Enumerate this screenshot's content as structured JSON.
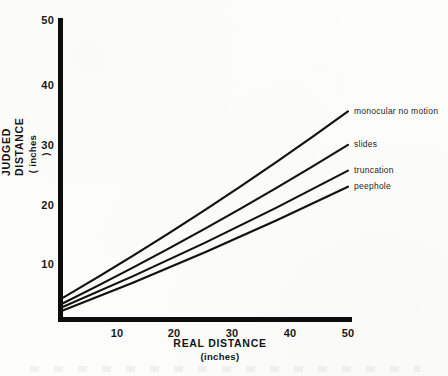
{
  "chart_data": {
    "type": "line",
    "title": "",
    "xlabel": "REAL DISTANCE",
    "xlabel_units": "(inches)",
    "ylabel": "JUDGED DISTANCE",
    "ylabel_units": "( inches )",
    "xlim": [
      0,
      50
    ],
    "ylim": [
      0,
      50
    ],
    "xticks": [
      10,
      20,
      30,
      40,
      50
    ],
    "yticks": [
      10,
      20,
      30,
      40,
      50
    ],
    "xtick_labels": [
      "10",
      "20",
      "30",
      "40",
      "50"
    ],
    "ytick_labels": [
      "10",
      "20",
      "30",
      "40",
      "50"
    ],
    "grid": false,
    "legend_position": "right-inline-at-line-ends",
    "x": [
      0,
      50
    ],
    "series": [
      {
        "name": "monocular no motion",
        "label": "monocular no motion",
        "values": [
          3.5,
          34.8
        ],
        "intercept": 3.5,
        "slope": 0.626,
        "color": "#111111",
        "label_y_px": 111
      },
      {
        "name": "slides",
        "label": "slides",
        "values": [
          2.6,
          29.2
        ],
        "intercept": 2.6,
        "slope": 0.532,
        "color": "#111111",
        "label_y_px": 144
      },
      {
        "name": "truncation",
        "label": "truncation",
        "values": [
          2.0,
          24.9
        ],
        "intercept": 2.0,
        "slope": 0.458,
        "color": "#111111",
        "label_y_px": 170
      },
      {
        "name": "peephole",
        "label": "peephole",
        "values": [
          1.4,
          22.2
        ],
        "intercept": 1.4,
        "slope": 0.416,
        "color": "#111111",
        "label_y_px": 186
      }
    ]
  },
  "axes": {
    "x_title": "REAL DISTANCE",
    "x_subtitle": "(inches)",
    "y_title": "JUDGED DISTANCE",
    "y_subtitle": "( inches )",
    "x_tick_labels": [
      "10",
      "20",
      "30",
      "40",
      "50"
    ],
    "y_tick_labels": [
      "10",
      "20",
      "30",
      "40",
      "50"
    ],
    "axis_color": "#0d0d0d"
  },
  "colors": {
    "ink": "#111111",
    "paper": "#fdfdfb",
    "axis": "#0d0d0d"
  }
}
